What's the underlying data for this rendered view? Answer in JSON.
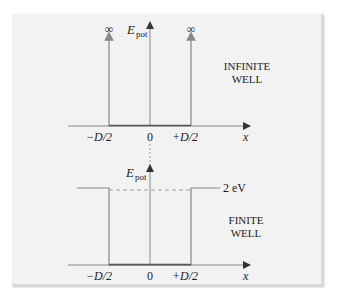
{
  "top_panel": {
    "title_line1": "INFINITE",
    "title_line2": "WELL",
    "y_axis_label": "E",
    "y_axis_subscript": "pot",
    "x_axis_label": "x",
    "infinity_left": "∞",
    "infinity_right": "∞",
    "ticks": [
      "−D/2",
      "0",
      "+D/2"
    ]
  },
  "bottom_panel": {
    "title_line1": "FINITE",
    "title_line2": "WELL",
    "y_axis_label": "E",
    "y_axis_subscript": "pot",
    "x_axis_label": "x",
    "barrier_label": "2 eV",
    "ticks": [
      "−D/2",
      "0",
      "+D/2"
    ]
  },
  "colors": {
    "card_bg": "#f2f2f2",
    "line": "#888888",
    "well_floor": "#555555",
    "text": "#222222"
  }
}
